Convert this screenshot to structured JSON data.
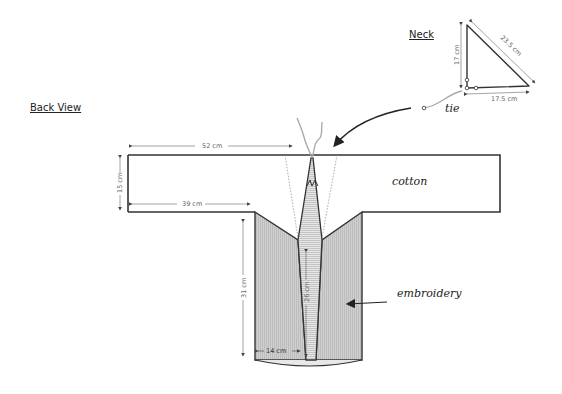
{
  "titles": {
    "back_view": "Back View",
    "neck": "Neck"
  },
  "labels": {
    "cotton": "cotton",
    "embroidery": "embroidery",
    "tie": "tie"
  },
  "dimensions": {
    "sleeve_width": "52 cm",
    "sleeve_height": "15 cm",
    "sleeve_underarm": "39 cm",
    "body_length": "31 cm",
    "strip_length": "26 cm",
    "panel_width": "14 cm",
    "neck_height": "17 cm",
    "neck_hypotenuse": "23.5 cm",
    "neck_base": "17.5 cm"
  },
  "colors": {
    "outline": "#333333",
    "embroidery_fill": "#c8c8c8",
    "strip_fill": "#dedede",
    "tie": "#aaaaaa",
    "dim_line": "#666666"
  }
}
